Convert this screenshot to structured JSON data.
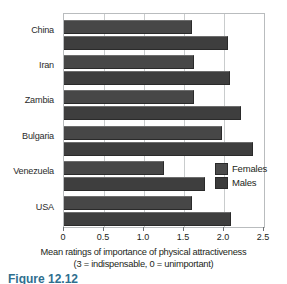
{
  "chart_data": {
    "type": "bar",
    "orientation": "horizontal",
    "title": "",
    "subtitle": "",
    "categories": [
      "China",
      "Iran",
      "Zambia",
      "Bulgaria",
      "Venezuela",
      "USA"
    ],
    "series": [
      {
        "name": "Females",
        "color": "#474747",
        "values": [
          1.6,
          1.63,
          1.62,
          1.97,
          1.25,
          1.6
        ]
      },
      {
        "name": "Males",
        "color": "#3e3e3e",
        "values": [
          2.05,
          2.08,
          2.21,
          2.36,
          1.76,
          2.09
        ]
      }
    ],
    "xlabel": "Mean ratings of importance of physical attractiveness",
    "xlabel_note": "(3 = indispensable, 0 = unimportant)",
    "ylabel": "",
    "xlim": [
      0,
      2.5
    ],
    "xticks": [
      0,
      0.5,
      1.0,
      1.5,
      2.0,
      2.5
    ],
    "xtick_labels": [
      "0",
      "0.5",
      "1.0",
      "1.5",
      "2.0",
      "2.5"
    ],
    "grid": "vertical",
    "legend_position": "inside-right",
    "legend_entries": [
      "Females",
      "Males"
    ]
  },
  "axis": {
    "title_line1": "Mean ratings of importance of physical attractiveness",
    "title_line2": "(3 = indispensable, 0 = unimportant)"
  },
  "legend": {
    "females_label": "Females",
    "males_label": "Males"
  },
  "caption": {
    "text": "Figure 12.12"
  }
}
